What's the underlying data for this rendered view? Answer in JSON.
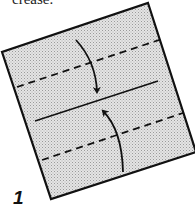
{
  "caption": "crease.",
  "step_number": "1",
  "diagram": {
    "paper_color": "#d8d8d8",
    "line_color": "#111111",
    "paper_corners": [
      [
        148,
        3
      ],
      [
        195,
        152
      ],
      [
        51,
        199
      ],
      [
        2,
        52
      ]
    ],
    "dashed_lines": [
      {
        "from": [
          17,
          87
        ],
        "to": [
          162,
          39
        ]
      },
      {
        "from": [
          42,
          160
        ],
        "to": [
          183,
          113
        ]
      }
    ],
    "solid_line": {
      "from": [
        35,
        121
      ],
      "to": [
        158,
        81
      ]
    },
    "arrows": [
      {
        "name": "fold-down",
        "from": [
          76,
          40
        ],
        "to": [
          97,
          96
        ]
      },
      {
        "name": "fold-up",
        "from": [
          123,
          172
        ],
        "to": [
          102,
          108
        ]
      }
    ]
  }
}
